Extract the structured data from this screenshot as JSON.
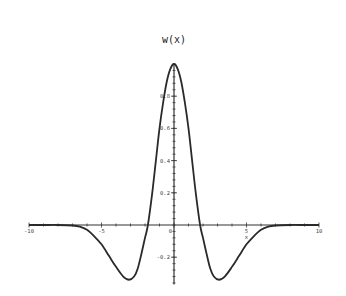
{
  "chart_data": {
    "type": "line",
    "title": "w(x)",
    "xlabel": "x",
    "ylabel": "",
    "xlim": [
      -10,
      10
    ],
    "ylim": [
      -0.37,
      1.0
    ],
    "grid": false,
    "legend": null,
    "x_ticks": [
      -10,
      -5,
      5,
      10
    ],
    "x_tick_labels": [
      "-10",
      "-5",
      "5",
      "10"
    ],
    "y_ticks": [
      -0.2,
      0.2,
      0.4,
      0.6,
      0.8
    ],
    "y_tick_labels": [
      "-0.2",
      "0.2",
      "0.4",
      "0.6",
      "0.8"
    ],
    "origin_label": "0",
    "series": [
      {
        "name": "w(x)",
        "x": [
          -10,
          -9,
          -8,
          -7,
          -6.5,
          -6,
          -5.5,
          -5,
          -4.5,
          -4,
          -3.5,
          -3.1,
          -2.75,
          -2.5,
          -2.25,
          -2,
          -1.8,
          -1.5,
          -1.25,
          -1,
          -0.75,
          -0.5,
          -0.25,
          0,
          0.25,
          0.5,
          0.75,
          1,
          1.25,
          1.5,
          1.8,
          2,
          2.25,
          2.5,
          2.75,
          3.1,
          3.5,
          4,
          4.5,
          5,
          5.5,
          6,
          6.5,
          7,
          8,
          9,
          10
        ],
        "values": [
          0,
          0,
          0,
          -0.003,
          -0.01,
          -0.03,
          -0.07,
          -0.12,
          -0.19,
          -0.26,
          -0.32,
          -0.34,
          -0.32,
          -0.27,
          -0.18,
          -0.08,
          0,
          0.2,
          0.4,
          0.6,
          0.76,
          0.89,
          0.97,
          1.0,
          0.97,
          0.89,
          0.76,
          0.6,
          0.4,
          0.2,
          0,
          -0.08,
          -0.18,
          -0.27,
          -0.32,
          -0.34,
          -0.32,
          -0.26,
          -0.19,
          -0.12,
          -0.07,
          -0.03,
          -0.01,
          -0.003,
          0,
          0,
          0
        ]
      }
    ]
  },
  "colors": {
    "curve": "#2a2a2a",
    "axes": "#333333",
    "background": "#ffffff"
  }
}
